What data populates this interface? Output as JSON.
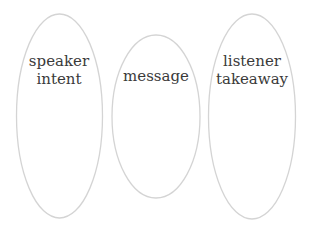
{
  "diagram": {
    "nodes": [
      {
        "id": "speaker-intent",
        "lines": [
          "speaker",
          "intent"
        ]
      },
      {
        "id": "message",
        "lines": [
          "message"
        ]
      },
      {
        "id": "listener-takeaway",
        "lines": [
          "listener",
          "takeaway"
        ]
      }
    ]
  }
}
